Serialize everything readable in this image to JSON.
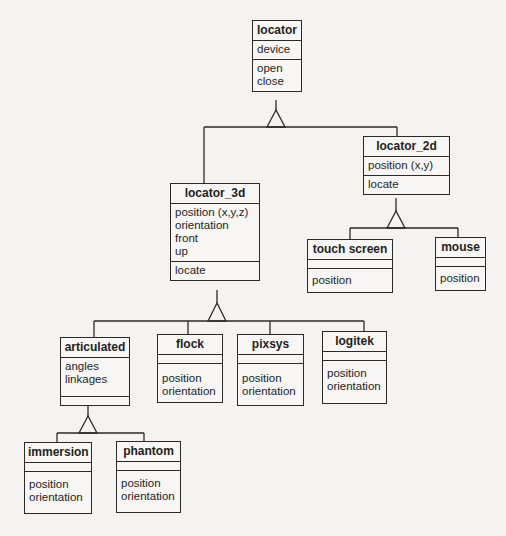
{
  "diagram": {
    "type": "uml-class-inheritance",
    "classes": {
      "locator": {
        "name": "locator",
        "attributes": [
          "device"
        ],
        "operations": [
          "open",
          "close"
        ]
      },
      "locator_2d": {
        "name": "locator_2d",
        "attributes": [
          "position (x,y)"
        ],
        "operations": [
          "locate"
        ]
      },
      "locator_3d": {
        "name": "locator_3d",
        "attributes": [
          "position (x,y,z)",
          "orientation",
          "front",
          "up"
        ],
        "operations": [
          "locate"
        ]
      },
      "touch_screen": {
        "name": "touch screen",
        "attributes": [],
        "operations": [
          "position"
        ]
      },
      "mouse": {
        "name": "mouse",
        "attributes": [],
        "operations": [
          "position"
        ]
      },
      "articulated": {
        "name": "articulated",
        "attributes": [
          "angles",
          "linkages"
        ],
        "operations": []
      },
      "flock": {
        "name": "flock",
        "attributes": [],
        "operations": [
          "position",
          "orientation"
        ]
      },
      "pixsys": {
        "name": "pixsys",
        "attributes": [],
        "operations": [
          "position",
          "orientation"
        ]
      },
      "logitek": {
        "name": "logitek",
        "attributes": [],
        "operations": [
          "position",
          "orientation"
        ]
      },
      "immersion": {
        "name": "immersion",
        "attributes": [],
        "operations": [
          "position",
          "orientation"
        ]
      },
      "phantom": {
        "name": "phantom",
        "attributes": [],
        "operations": [
          "position",
          "orientation"
        ]
      }
    },
    "generalizations": [
      {
        "parent": "locator",
        "children": [
          "locator_3d",
          "locator_2d"
        ]
      },
      {
        "parent": "locator_2d",
        "children": [
          "touch screen",
          "mouse"
        ]
      },
      {
        "parent": "locator_3d",
        "children": [
          "articulated",
          "flock",
          "pixsys",
          "logitek"
        ]
      },
      {
        "parent": "articulated",
        "children": [
          "immersion",
          "phantom"
        ]
      }
    ],
    "colors": {
      "line": "#2a2a2a",
      "background": "#f4f3f1"
    }
  }
}
